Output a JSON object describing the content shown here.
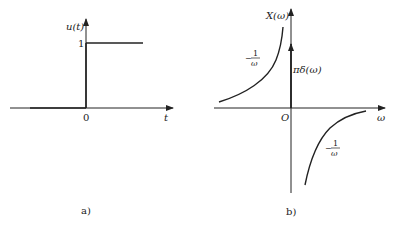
{
  "figure_a": {
    "caption": "a)",
    "y_label": "u(t)",
    "x_label": "t",
    "origin_label": "0",
    "level_label": "1",
    "description": "Unit step function u(t): 0 for t<0, 1 for t>=0"
  },
  "figure_b": {
    "caption": "b)",
    "y_label": "X(ω)",
    "x_label": "ω",
    "origin_label": "O",
    "left_curve_label_num": "1",
    "left_curve_label_den": "ω",
    "left_curve_sign": "−",
    "impulse_label": "πδ(ω)",
    "right_curve_label_num": "1",
    "right_curve_label_den": "ω",
    "right_curve_sign": "−",
    "description": "Spectrum X(ω) = πδ(ω) − 1/ω (imaginary part)"
  },
  "colors": {
    "line": "#222222",
    "background": "#ffffff"
  }
}
